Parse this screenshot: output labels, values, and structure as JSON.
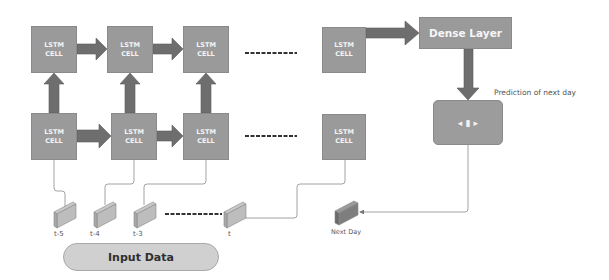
{
  "diagram": {
    "lstm_cell_label_line1": "LSTM",
    "lstm_cell_label_line2": "CELL",
    "top_row_cells": [
      {
        "id": "top-1",
        "line1": "LSTM",
        "line2": "CELL"
      },
      {
        "id": "top-2",
        "line1": "LSTM",
        "line2": "CELL"
      },
      {
        "id": "top-3",
        "line1": "LSTM",
        "line2": "CELL"
      },
      {
        "id": "top-last",
        "line1": "LSTM",
        "line2": "CELL"
      }
    ],
    "bottom_row_cells": [
      {
        "id": "bottom-1",
        "line1": "LSTM",
        "line2": "CELL"
      },
      {
        "id": "bottom-2",
        "line1": "LSTM",
        "line2": "CELL"
      },
      {
        "id": "bottom-3",
        "line1": "LSTM",
        "line2": "CELL"
      },
      {
        "id": "bottom-last",
        "line1": "LSTM",
        "line2": "CELL"
      }
    ],
    "dense_layer": "Dense Layer",
    "output_node_symbol": "◂ ▮ ▸",
    "prediction_label": "Prediction of next day",
    "inputs": [
      "t-5",
      "t-4",
      "t-3",
      "t"
    ],
    "next_day_label": "Next Day",
    "input_data_label": "Input Data",
    "colors": {
      "box_fill": "#9a9a9a",
      "arrow_fill": "#6e6e6e",
      "pill_fill": "#d0d0d0",
      "line": "#8c8c8c"
    }
  }
}
